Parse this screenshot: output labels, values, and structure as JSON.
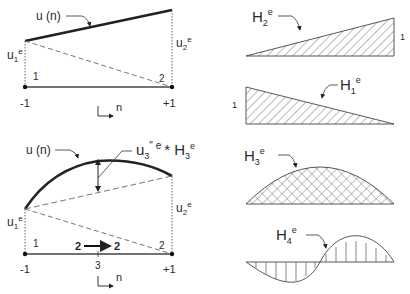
{
  "panels": {
    "linear": {
      "curve_label": "u (n)",
      "u1_label": "u",
      "u1_sub": "1",
      "u2_label": "u",
      "u2_sub": "2",
      "sup_e": "e",
      "node1": "1",
      "node2": "2",
      "xmin": "-1",
      "xmax": "+1",
      "axis": "n"
    },
    "quadratic": {
      "curve_label": "u (n)",
      "bubble_label_u": "u",
      "bubble_sub": "3",
      "bubble_sup": "\" e",
      "bubble_times": "* H",
      "bubble_h_sub": "3",
      "bubble_h_sup": "e",
      "u1_label": "u",
      "u1_sub": "1",
      "u2_label": "u",
      "u2_sub": "2",
      "sup_e": "e",
      "node1": "1",
      "node2": "2",
      "mid_from": "2",
      "mid_to": "2",
      "mid_node": "3",
      "xmin": "-1",
      "xmax": "+1",
      "axis": "n"
    },
    "shape_functions": [
      {
        "name": "H",
        "sub": "2",
        "sup": "e",
        "value_label": "1"
      },
      {
        "name": "H",
        "sub": "1",
        "sup": "e",
        "value_label": "1"
      },
      {
        "name": "H",
        "sub": "3",
        "sup": "e"
      },
      {
        "name": "H",
        "sub": "4",
        "sup": "e"
      }
    ]
  },
  "colors": {
    "line": "#222222",
    "hatch": "#555555",
    "dashed": "#666666"
  }
}
